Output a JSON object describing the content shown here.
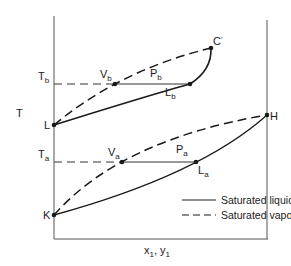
{
  "diagram": {
    "type": "phase-diagram",
    "axes": {
      "y_label": "T",
      "x_label": "x",
      "x_label_sub": "1",
      "x_label_sep": ", ",
      "x_label2": "y",
      "x_label2_sub": "1"
    },
    "temperature_levels": [
      {
        "main": "T",
        "sub": "b"
      },
      {
        "main": "T",
        "sub": "a"
      }
    ],
    "points": {
      "L": {
        "main": "L",
        "sub": ""
      },
      "K": {
        "main": "K",
        "sub": ""
      },
      "H": {
        "main": "H",
        "sub": ""
      },
      "C_prime": {
        "main": "C",
        "sub": "'"
      },
      "V_b": {
        "main": "V",
        "sub": "b"
      },
      "P_b": {
        "main": "P",
        "sub": "b"
      },
      "L_b": {
        "main": "L",
        "sub": "b"
      },
      "V_a": {
        "main": "V",
        "sub": "a"
      },
      "P_a": {
        "main": "P",
        "sub": "a"
      },
      "L_a": {
        "main": "L",
        "sub": "a"
      }
    },
    "legend": [
      {
        "style": "solid",
        "label": "Saturated liquid"
      },
      {
        "style": "dashed",
        "label": "Saturated vapor"
      }
    ],
    "colors": {
      "line": "#1a1a1a",
      "axis": "#555555",
      "background": "#ffffff"
    }
  }
}
